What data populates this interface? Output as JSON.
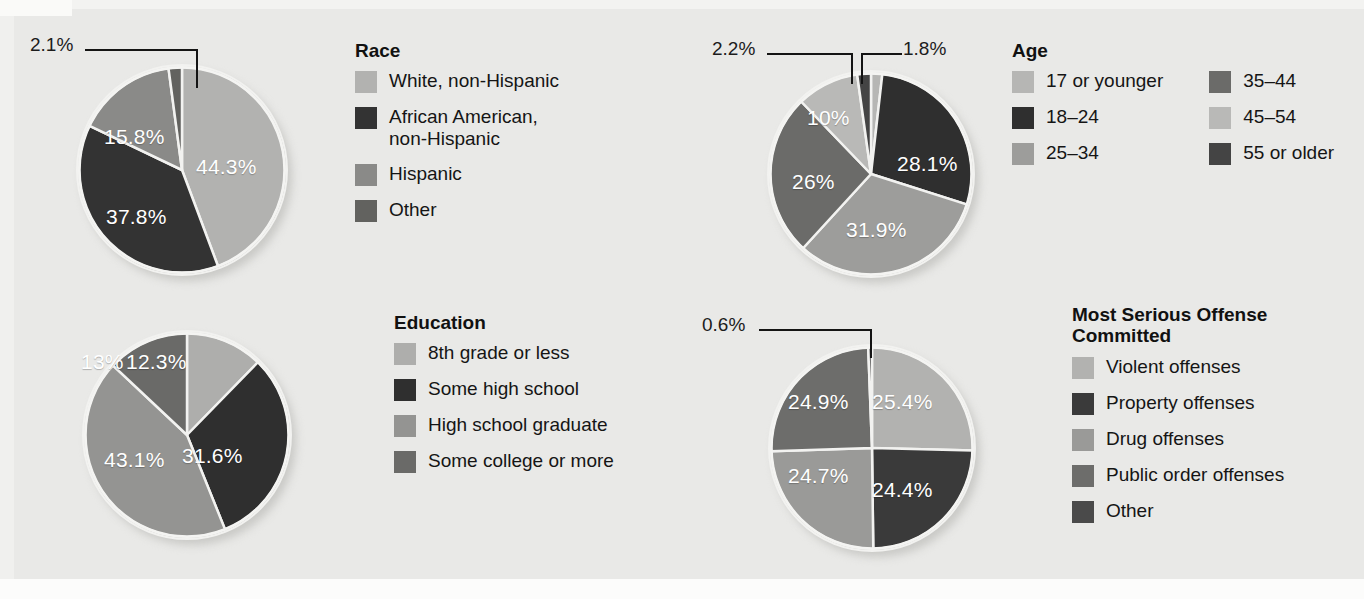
{
  "figure": {
    "background": "#e9e9e7",
    "text_color": "#151515",
    "slice_label_color": "#ffffff",
    "pie_gap_color": "#f2f2f0"
  },
  "palette": {
    "light": "#b2b2b0",
    "lighter": "#bfbfbd",
    "mid_light": "#9a9a98",
    "mid": "#888886",
    "mid_dark": "#6e6e6c",
    "dark": "#5a5a58",
    "darkest": "#333333"
  },
  "chart_data": [
    {
      "id": "race",
      "type": "pie",
      "title": "Race",
      "start_angle": 0,
      "categories": [
        "White, non-Hispanic",
        "African American,\nnon-Hispanic",
        "Hispanic",
        "Other"
      ],
      "values": [
        44.3,
        37.8,
        15.8,
        2.1
      ],
      "value_labels": [
        "44.3%",
        "37.8%",
        "15.8%",
        "2.1%"
      ],
      "colors": [
        "#b2b2b0",
        "#333333",
        "#8a8a88",
        "#62625f"
      ],
      "callout_labels": [
        "2.1%"
      ],
      "legend_columns": 1
    },
    {
      "id": "age",
      "type": "pie",
      "title": "Age",
      "start_angle": 0,
      "categories": [
        "17 or younger",
        "18–24",
        "25–34",
        "35–44",
        "45–54",
        "55 or older"
      ],
      "values": [
        1.8,
        28.1,
        31.9,
        26.0,
        10.0,
        2.2
      ],
      "value_labels": [
        "1.8%",
        "28.1%",
        "31.9%",
        "26%",
        "10%",
        "2.2%"
      ],
      "colors": [
        "#b6b6b4",
        "#2f2f2f",
        "#9d9d9b",
        "#6b6b69",
        "#b9b9b7",
        "#444444"
      ],
      "callout_labels": [
        "2.2%",
        "1.8%"
      ],
      "legend_columns": 2
    },
    {
      "id": "education",
      "type": "pie",
      "title": "Education",
      "start_angle": 0,
      "categories": [
        "8th grade or less",
        "Some high school",
        "High school graduate",
        "Some college or more"
      ],
      "values": [
        12.3,
        31.6,
        43.1,
        13.0
      ],
      "value_labels": [
        "12.3%",
        "31.6%",
        "43.1%",
        "13%"
      ],
      "colors": [
        "#aeaeac",
        "#2f2f2f",
        "#949492",
        "#6a6a68"
      ],
      "callout_labels": [],
      "legend_columns": 1
    },
    {
      "id": "offense",
      "type": "pie",
      "title": "Most Serious Offense\nCommitted",
      "start_angle": 0,
      "categories": [
        "Violent offenses",
        "Property offenses",
        "Drug offenses",
        "Public order offenses",
        "Other"
      ],
      "values": [
        25.4,
        24.4,
        24.7,
        24.9,
        0.6
      ],
      "value_labels": [
        "25.4%",
        "24.4%",
        "24.7%",
        "24.9%",
        "0.6%"
      ],
      "colors": [
        "#b2b2b0",
        "#3a3a3a",
        "#9a9a98",
        "#6d6d6b",
        "#4a4a4a"
      ],
      "callout_labels": [
        "0.6%"
      ],
      "legend_columns": 1
    }
  ],
  "race": {
    "title": "Race",
    "callout": {
      "other": "2.1%"
    },
    "slices": {
      "white": "44.3%",
      "african_american": "37.8%",
      "hispanic": "15.8%"
    },
    "legend": [
      {
        "label": "White, non-Hispanic",
        "color": "#b2b2b0"
      },
      {
        "label": "African American,\nnon-Hispanic",
        "color": "#333333"
      },
      {
        "label": "Hispanic",
        "color": "#8a8a88"
      },
      {
        "label": "Other",
        "color": "#62625f"
      }
    ]
  },
  "age": {
    "title": "Age",
    "callouts": {
      "older": "2.2%",
      "younger": "1.8%"
    },
    "slices": {
      "a18_24": "28.1%",
      "a25_34": "31.9%",
      "a35_44": "26%",
      "a45_54": "10%"
    },
    "legend_left": [
      {
        "label": "17 or younger",
        "color": "#b6b6b4"
      },
      {
        "label": "18–24",
        "color": "#2f2f2f"
      },
      {
        "label": "25–34",
        "color": "#9d9d9b"
      }
    ],
    "legend_right": [
      {
        "label": "35–44",
        "color": "#6b6b69"
      },
      {
        "label": "45–54",
        "color": "#b9b9b7"
      },
      {
        "label": "55 or older",
        "color": "#444444"
      }
    ]
  },
  "education": {
    "title": "Education",
    "slices": {
      "grade8": "12.3%",
      "some_hs": "31.6%",
      "hs_grad": "43.1%",
      "some_college": "13%"
    },
    "legend": [
      {
        "label": "8th grade or less",
        "color": "#aeaeac"
      },
      {
        "label": "Some high school",
        "color": "#2f2f2f"
      },
      {
        "label": "High school graduate",
        "color": "#949492"
      },
      {
        "label": "Some college or more",
        "color": "#6a6a68"
      }
    ]
  },
  "offense": {
    "title": "Most Serious Offense\nCommitted",
    "callout": {
      "other": "0.6%"
    },
    "slices": {
      "violent": "25.4%",
      "property": "24.4%",
      "drug": "24.7%",
      "public_order": "24.9%"
    },
    "legend": [
      {
        "label": "Violent offenses",
        "color": "#b2b2b0"
      },
      {
        "label": "Property offenses",
        "color": "#3a3a3a"
      },
      {
        "label": "Drug offenses",
        "color": "#9a9a98"
      },
      {
        "label": "Public order offenses",
        "color": "#6d6d6b"
      },
      {
        "label": "Other",
        "color": "#4a4a4a"
      }
    ]
  }
}
